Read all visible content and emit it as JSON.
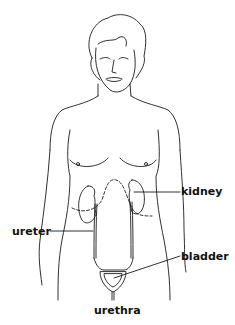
{
  "diagram": {
    "labels": [
      {
        "id": "kidney",
        "text": "kidney",
        "x": 181,
        "y": 185
      },
      {
        "id": "ureter",
        "text": "ureter",
        "x": 12,
        "y": 226
      },
      {
        "id": "bladder",
        "text": "bladder",
        "x": 181,
        "y": 251
      },
      {
        "id": "urethra",
        "text": "urethra",
        "x": 94,
        "y": 305
      }
    ],
    "colors": {
      "line": "#1a1a1a",
      "background": "#ffffff",
      "text": "#111111"
    }
  }
}
